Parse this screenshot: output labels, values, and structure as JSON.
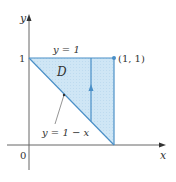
{
  "diagram": {
    "type": "region-of-integration",
    "region_label": "D",
    "axes": {
      "x_label": "x",
      "y_label": "y",
      "origin_label": "0",
      "y_tick_label": "1"
    },
    "curves": {
      "top_boundary_label": "y = 1",
      "diagonal_boundary_label": "y = 1 − x"
    },
    "point_label": "(1, 1)",
    "colors": {
      "fill": "#cfe6f5",
      "boundary": "#4a8fc7",
      "axis": "#666666",
      "text": "#333333"
    }
  }
}
